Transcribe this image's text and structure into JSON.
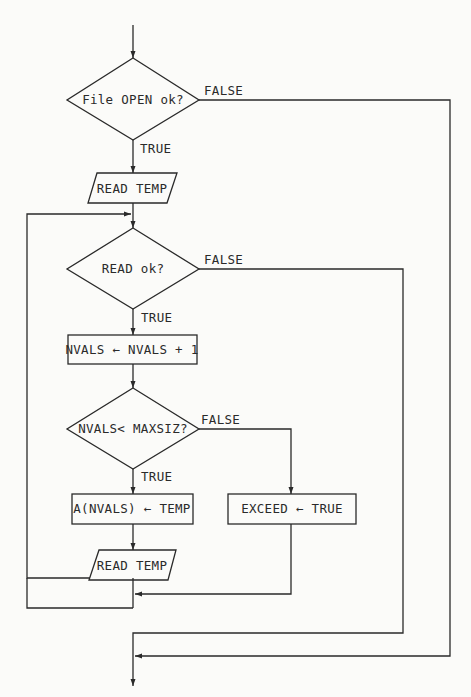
{
  "nodes": {
    "open_check": {
      "text": "File OPEN ok?",
      "shape": "decision"
    },
    "read_temp_1": {
      "text": "READ TEMP",
      "shape": "io"
    },
    "read_check": {
      "text": "READ ok?",
      "shape": "decision"
    },
    "increment": {
      "text": "NVALS ← NVALS + 1",
      "shape": "process"
    },
    "size_check": {
      "text": "NVALS< MAXSIZ?",
      "shape": "decision"
    },
    "store": {
      "text": "A(NVALS) ← TEMP",
      "shape": "process"
    },
    "exceed": {
      "text": "EXCEED ←  TRUE",
      "shape": "process"
    },
    "read_temp_2": {
      "text": "READ TEMP",
      "shape": "io"
    }
  },
  "edges": {
    "open_true": "TRUE",
    "open_false": "FALSE",
    "read_true": "TRUE",
    "read_false": "FALSE",
    "size_true": "TRUE",
    "size_false": "FALSE"
  }
}
